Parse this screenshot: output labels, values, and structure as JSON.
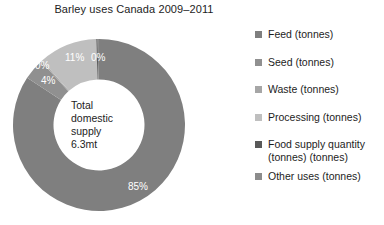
{
  "chart_data": {
    "type": "pie",
    "variant": "donut",
    "title": "Barley uses Canada 2009–2011",
    "xlabel": "",
    "ylabel": "",
    "center_label": [
      "Total",
      "domestic",
      "supply",
      "6.3mt"
    ],
    "legend_position": "right",
    "grid": false,
    "categories": [
      "Feed (tonnes)",
      "Seed (tonnes)",
      "Waste (tonnes)",
      "Processing (tonnes)",
      "Food supply quantity (tonnes) (tonnes)",
      "Other uses (tonnes)"
    ],
    "values": [
      85,
      4,
      0,
      11,
      0,
      0
    ],
    "data_labels": [
      "85%",
      "4%",
      "0%",
      "11%",
      "0%",
      "0%"
    ],
    "colors": [
      "#7f7f7f",
      "#909090",
      "#a6a6a6",
      "#bfbfbf",
      "#595959",
      "#8c8c8c"
    ],
    "slices": [
      {
        "name": "Feed (tonnes)",
        "value": 85,
        "label": "85%",
        "color": "#7f7f7f"
      },
      {
        "name": "Seed (tonnes)",
        "value": 4,
        "label": "4%",
        "color": "#909090"
      },
      {
        "name": "Waste (tonnes)",
        "value": 0,
        "label": "0%",
        "color": "#a6a6a6"
      },
      {
        "name": "Processing (tonnes)",
        "value": 11,
        "label": "11%",
        "color": "#bfbfbf"
      },
      {
        "name": "Food supply quantity (tonnes) (tonnes)",
        "value": 0,
        "label": "0%",
        "color": "#595959"
      },
      {
        "name": "Other uses (tonnes)",
        "value": 0,
        "label": "0%",
        "color": "#8c8c8c"
      }
    ]
  },
  "center": {
    "line1": "Total",
    "line2": "domestic",
    "line3": "supply",
    "line4": "6.3mt"
  },
  "labels": {
    "feed": "85%",
    "seed": "4%",
    "waste": "0%",
    "processing": "11%",
    "food_supply": "0%",
    "other": "0%"
  },
  "legend": {
    "items": [
      {
        "label": "Feed (tonnes)",
        "color": "#7f7f7f"
      },
      {
        "label": "Seed (tonnes)",
        "color": "#909090"
      },
      {
        "label": "Waste (tonnes)",
        "color": "#a6a6a6"
      },
      {
        "label": "Processing (tonnes)",
        "color": "#bfbfbf"
      },
      {
        "label": "Food supply quantity",
        "label2": "(tonnes) (tonnes)",
        "color": "#595959"
      },
      {
        "label": "Other uses (tonnes)",
        "color": "#8c8c8c"
      }
    ]
  }
}
